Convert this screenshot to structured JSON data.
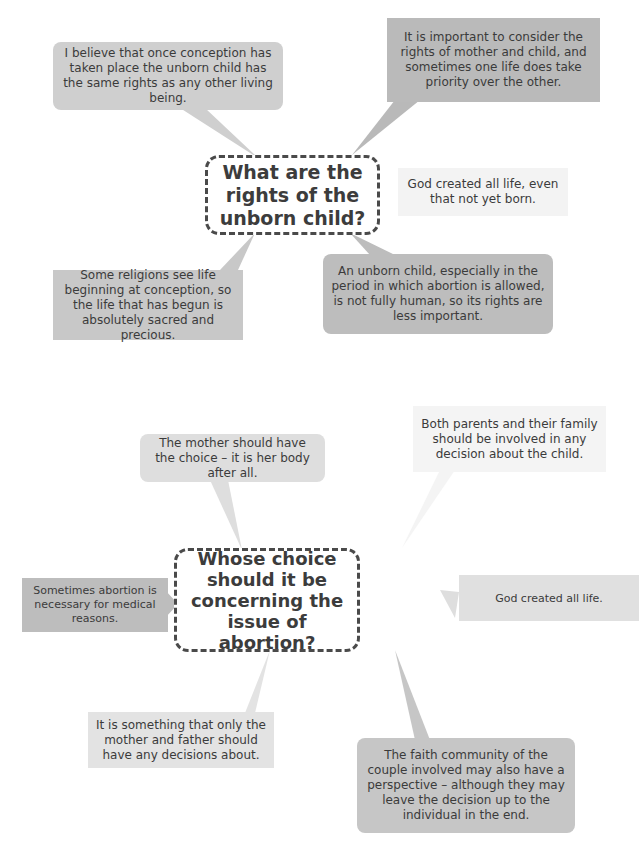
{
  "colors": {
    "bubble_mid": "#c8c8c8",
    "bubble_dark": "#b9b9b9",
    "bubble_light": "#dedede",
    "bubble_faint": "#f3f3f3",
    "center_border": "#4a4a4a",
    "text": "#3b3b3b"
  },
  "diagram1": {
    "center": "What are the rights of the unborn child?",
    "bubbles": [
      {
        "id": "top-left",
        "text": "I believe that once conception has taken place the unborn child has the same rights as any other living being."
      },
      {
        "id": "top-right",
        "text": "It is important to consider the rights of mother and child, and sometimes one life does take priority over the other."
      },
      {
        "id": "right",
        "text": "God created all life, even that not yet born."
      },
      {
        "id": "bottom-left",
        "text": "Some religions see life beginning at conception, so the life that has begun is absolutely sacred and precious."
      },
      {
        "id": "bottom-right",
        "text": "An unborn child, especially in the period in which abortion is allowed, is not fully human, so its rights are less important."
      }
    ]
  },
  "diagram2": {
    "center": "Whose choice should it be concerning the issue of abortion?",
    "bubbles": [
      {
        "id": "top-left",
        "text": "The mother should have the choice – it is her body after all."
      },
      {
        "id": "top-right",
        "text": "Both parents and their family should be involved in any decision about the child."
      },
      {
        "id": "left",
        "text": "Sometimes abortion is necessary for medical reasons."
      },
      {
        "id": "right",
        "text": "God created all life."
      },
      {
        "id": "bottom-left",
        "text": "It is something that only the mother and father should have any decisions about."
      },
      {
        "id": "bottom-right",
        "text": "The faith community of the couple involved may also have a perspective – although they may leave the decision up to the individual in the end."
      }
    ]
  }
}
